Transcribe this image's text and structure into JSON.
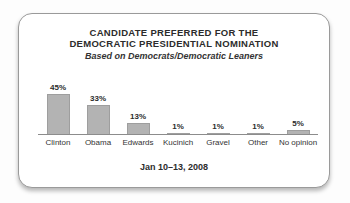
{
  "card": {
    "title_line1": "CANDIDATE PREFERRED FOR THE",
    "title_line2": "DEMOCRATIC PRESIDENTIAL NOMINATION",
    "subtitle": "Based on Democrats/Democratic Leaners",
    "date_label": "Jan 10–13, 2008"
  },
  "chart_data": {
    "type": "bar",
    "title": "CANDIDATE PREFERRED FOR THE DEMOCRATIC PRESIDENTIAL NOMINATION",
    "subtitle": "Based on Democrats/Democratic Leaners",
    "categories": [
      "Clinton",
      "Obama",
      "Edwards",
      "Kucinich",
      "Gravel",
      "Other",
      "No opinion"
    ],
    "values": [
      45,
      33,
      13,
      1,
      1,
      1,
      5
    ],
    "value_labels": [
      "45%",
      "33%",
      "13%",
      "1%",
      "1%",
      "1%",
      "5%"
    ],
    "xlabel": "",
    "ylabel": "",
    "ylim": [
      0,
      50
    ],
    "grid": false,
    "legend_position": "none",
    "footnote": "Jan 10–13, 2008",
    "bar_color": "#b3b3b3",
    "bar_border_color": "#9e9e9e",
    "axis_color": "#8c8c8c",
    "text_color": "#2c2c2c"
  }
}
